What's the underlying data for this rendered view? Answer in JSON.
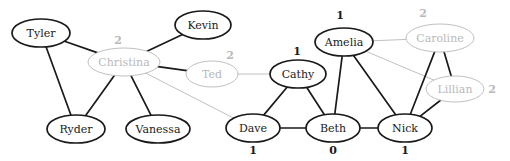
{
  "diagram": {
    "type": "node-link-graph",
    "width": 510,
    "height": 161,
    "background_color": "#ffffff",
    "colors": {
      "active_node_stroke": "#1a1a1a",
      "active_node_text": "#1a1a1a",
      "faded_node_stroke": "#b9b9b9",
      "faded_node_text": "#b9b9b9",
      "active_edge": "#1a1a1a",
      "faded_edge": "#b9b9b9",
      "count_active_text": "#1a1a1a",
      "count_faded_text": "#b9b9b9"
    },
    "nodes": [
      {
        "id": "tyler",
        "label": "Tyler",
        "cx": 41,
        "cy": 33,
        "rx": 29,
        "ry": 14,
        "state": "active",
        "count": null,
        "count_x": null,
        "count_y": null
      },
      {
        "id": "kevin",
        "label": "Kevin",
        "cx": 203,
        "cy": 25,
        "rx": 28,
        "ry": 14,
        "state": "active",
        "count": null,
        "count_x": null,
        "count_y": null
      },
      {
        "id": "christina",
        "label": "Christina",
        "cx": 124,
        "cy": 62,
        "rx": 36,
        "ry": 14,
        "state": "faded",
        "count": "2",
        "count_x": 118,
        "count_y": 41
      },
      {
        "id": "ryder",
        "label": "Ryder",
        "cx": 76,
        "cy": 129,
        "rx": 29,
        "ry": 14,
        "state": "active",
        "count": null,
        "count_x": null,
        "count_y": null
      },
      {
        "id": "vanessa",
        "label": "Vanessa",
        "cx": 158,
        "cy": 129,
        "rx": 32,
        "ry": 14,
        "state": "active",
        "count": null,
        "count_x": null,
        "count_y": null
      },
      {
        "id": "ted",
        "label": "Ted",
        "cx": 212,
        "cy": 74,
        "rx": 26,
        "ry": 13,
        "state": "faded",
        "count": "2",
        "count_x": 230,
        "count_y": 56
      },
      {
        "id": "cathy",
        "label": "Cathy",
        "cx": 298,
        "cy": 74,
        "rx": 28,
        "ry": 14,
        "state": "active",
        "count": "1",
        "count_x": 297,
        "count_y": 52
      },
      {
        "id": "amelia",
        "label": "Amelia",
        "cx": 344,
        "cy": 42,
        "rx": 29,
        "ry": 14,
        "state": "active",
        "count": "1",
        "count_x": 340,
        "count_y": 16
      },
      {
        "id": "caroline",
        "label": "Caroline",
        "cx": 440,
        "cy": 38,
        "rx": 34,
        "ry": 14,
        "state": "faded",
        "count": "2",
        "count_x": 423,
        "count_y": 14
      },
      {
        "id": "lillian",
        "label": "Lillian",
        "cx": 455,
        "cy": 89,
        "rx": 29,
        "ry": 13,
        "state": "faded",
        "count": "2",
        "count_x": 492,
        "count_y": 90
      },
      {
        "id": "dave",
        "label": "Dave",
        "cx": 253,
        "cy": 128,
        "rx": 27,
        "ry": 14,
        "state": "active",
        "count": "1",
        "count_x": 253,
        "count_y": 151
      },
      {
        "id": "beth",
        "label": "Beth",
        "cx": 333,
        "cy": 128,
        "rx": 27,
        "ry": 14,
        "state": "active",
        "count": "0",
        "count_x": 333,
        "count_y": 151
      },
      {
        "id": "nick",
        "label": "Nick",
        "cx": 405,
        "cy": 128,
        "rx": 27,
        "ry": 14,
        "state": "active",
        "count": "1",
        "count_x": 405,
        "count_y": 151
      }
    ],
    "edges": [
      {
        "source": "tyler",
        "target": "christina",
        "state": "active"
      },
      {
        "source": "tyler",
        "target": "ryder",
        "state": "active"
      },
      {
        "source": "christina",
        "target": "kevin",
        "state": "active"
      },
      {
        "source": "christina",
        "target": "ted",
        "state": "active"
      },
      {
        "source": "christina",
        "target": "ryder",
        "state": "active"
      },
      {
        "source": "christina",
        "target": "vanessa",
        "state": "active"
      },
      {
        "source": "christina",
        "target": "dave",
        "state": "faded"
      },
      {
        "source": "ted",
        "target": "cathy",
        "state": "faded"
      },
      {
        "source": "cathy",
        "target": "dave",
        "state": "active"
      },
      {
        "source": "cathy",
        "target": "beth",
        "state": "active"
      },
      {
        "source": "amelia",
        "target": "caroline",
        "state": "faded"
      },
      {
        "source": "amelia",
        "target": "lillian",
        "state": "faded"
      },
      {
        "source": "amelia",
        "target": "beth",
        "state": "active"
      },
      {
        "source": "amelia",
        "target": "nick",
        "state": "active"
      },
      {
        "source": "caroline",
        "target": "lillian",
        "state": "active"
      },
      {
        "source": "caroline",
        "target": "nick",
        "state": "active"
      },
      {
        "source": "lillian",
        "target": "nick",
        "state": "active"
      },
      {
        "source": "dave",
        "target": "beth",
        "state": "active"
      },
      {
        "source": "beth",
        "target": "nick",
        "state": "active"
      }
    ]
  }
}
